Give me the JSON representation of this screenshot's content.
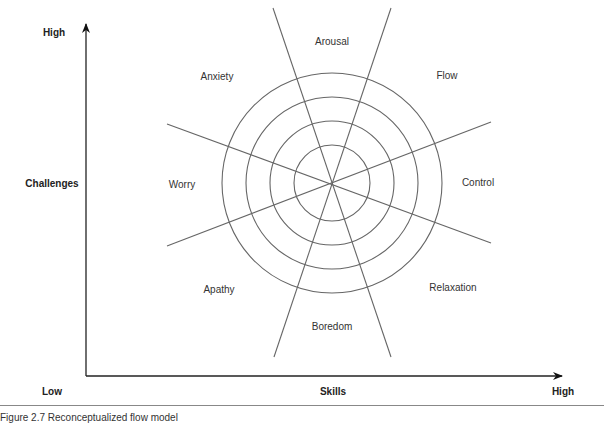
{
  "diagram": {
    "title": "Reconceptualized flow model",
    "caption": "Figure 2.7   Reconceptualized flow model",
    "y_axis": {
      "label": "Challenges",
      "high": "High",
      "low": "Low"
    },
    "x_axis": {
      "label": "Skills",
      "high": "High"
    },
    "center": [
      332,
      183
    ],
    "ring_radii": [
      38,
      67,
      90,
      110
    ],
    "sectors": [
      {
        "label": "Arousal"
      },
      {
        "label": "Flow"
      },
      {
        "label": "Control"
      },
      {
        "label": "Relaxation"
      },
      {
        "label": "Boredom"
      },
      {
        "label": "Apathy"
      },
      {
        "label": "Worry"
      },
      {
        "label": "Anxiety"
      }
    ],
    "line_color": "#555555"
  }
}
